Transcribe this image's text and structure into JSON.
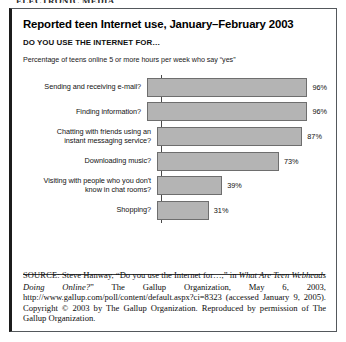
{
  "page": {
    "top_cut_text": "ELECTRONIC MEDIA"
  },
  "figure": {
    "title": "Reported teen Internet use, January–February 2003",
    "subtitle": "DO YOU USE THE INTERNET FOR…",
    "note": "Percentage of teens online 5 or more hours per week who say “yes”"
  },
  "chart_data": {
    "type": "bar",
    "orientation": "horizontal",
    "title": "Reported teen Internet use, January–February 2003",
    "subtitle": "DO YOU USE THE INTERNET FOR…",
    "note": "Percentage of teens online 5 or more hours per week who say “yes”",
    "xlabel": "",
    "ylabel": "",
    "xlim": [
      0,
      100
    ],
    "grid": false,
    "legend": false,
    "categories": [
      "Sending and receiving e-mail?",
      "Finding information?",
      "Chatting with friends using an instant messaging service?",
      "Downloading music?",
      "Visiting with people who you don't know in chat rooms?",
      "Shopping?"
    ],
    "values": [
      96,
      96,
      87,
      73,
      39,
      31
    ],
    "value_labels": [
      "96%",
      "96%",
      "87%",
      "73%",
      "39%",
      "31%"
    ],
    "bars": [
      {
        "label": "Sending and receiving e-mail?",
        "label_lines": [
          "Sending and receiving e-mail?"
        ],
        "value": 96,
        "value_label": "96%"
      },
      {
        "label": "Finding information?",
        "label_lines": [
          "Finding information?"
        ],
        "value": 96,
        "value_label": "96%"
      },
      {
        "label": "Chatting with friends using an instant messaging service?",
        "label_lines": [
          "Chatting with friends using an",
          "instant messaging service?"
        ],
        "value": 87,
        "value_label": "87%"
      },
      {
        "label": "Downloading music?",
        "label_lines": [
          "Downloading music?"
        ],
        "value": 73,
        "value_label": "73%"
      },
      {
        "label": "Visiting with people who you don't know in chat rooms?",
        "label_lines": [
          "Visiting with people who you don't",
          "know in chat rooms?"
        ],
        "value": 39,
        "value_label": "39%"
      },
      {
        "label": "Shopping?",
        "label_lines": [
          "Shopping?"
        ],
        "value": 31,
        "value_label": "31%"
      }
    ],
    "colors": {
      "bar_fill": "#b4b4b4",
      "bar_border": "#6e6e6e",
      "axis": "#4a4a4a",
      "text": "#000000"
    }
  },
  "source": {
    "label": "SOURCE:",
    "part1": " Steve Hanway, “Do you use the Internet for…,” in ",
    "italic1": "What Are Teen Webheads Doing Online?",
    "part2": "” The Gallup Organization, May 6, 2003, http://www.gallup.com/poll/content/default.aspx?ci=8323 (accessed January 9, 2005). Copyright © 2003 by The Gallup Organization. Reproduced by permission of The Gallup Organization."
  }
}
